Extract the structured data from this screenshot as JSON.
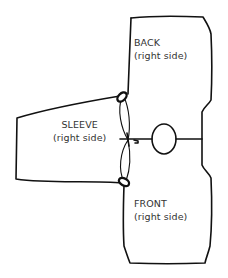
{
  "diagram": {
    "type": "knitting-assembly-diagram",
    "pieces": [
      {
        "id": "back",
        "title": "BACK",
        "subtitle": "(right side)"
      },
      {
        "id": "sleeve",
        "title": "SLEEVE",
        "subtitle": "(right side)"
      },
      {
        "id": "front",
        "title": "FRONT",
        "subtitle": "(right side)"
      }
    ],
    "annotations": {
      "markers": [
        "upper-stitch-marker",
        "lower-stitch-marker"
      ],
      "center": "shoulder-seam-join",
      "neck": "neck-opening"
    },
    "colors": {
      "line": "#111111",
      "text": "#333333",
      "background": "#ffffff"
    }
  }
}
